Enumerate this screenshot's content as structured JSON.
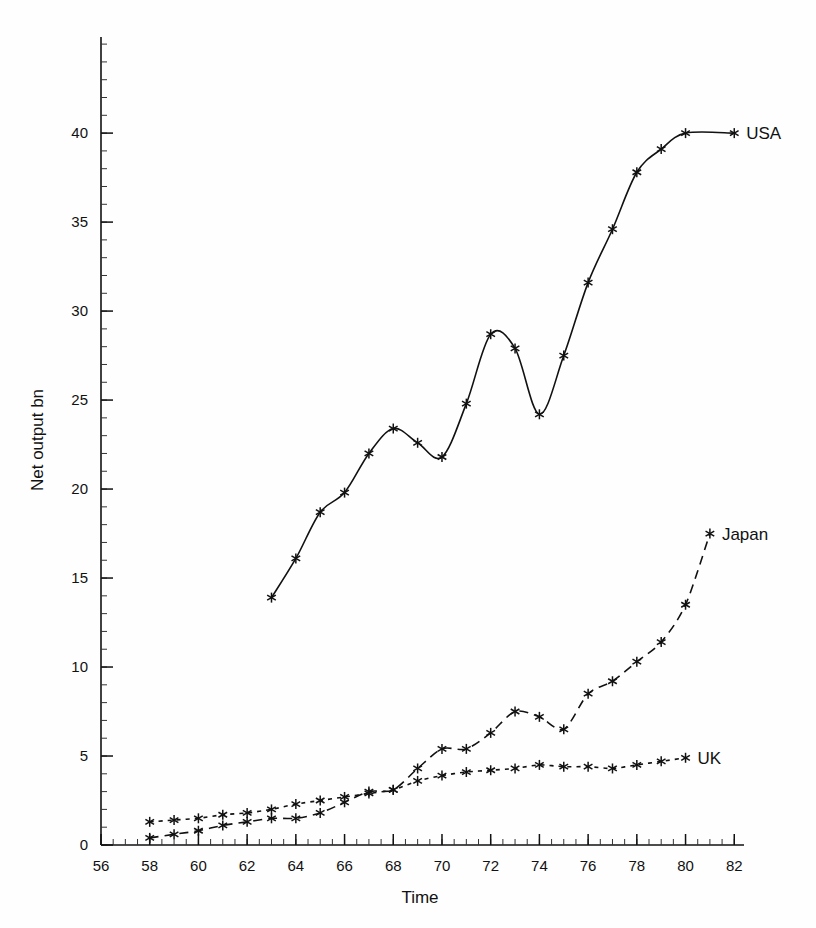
{
  "chart_data": {
    "type": "line",
    "title": "",
    "xlabel": "Time",
    "ylabel": "Net output bn",
    "xlim": [
      56,
      82.4
    ],
    "ylim": [
      0,
      45.4
    ],
    "xticks": [
      56,
      58,
      60,
      62,
      64,
      66,
      68,
      70,
      72,
      74,
      76,
      78,
      80,
      82
    ],
    "xtick_labels": [
      "56",
      "58",
      "60",
      "62",
      "64",
      "66",
      "68",
      "70",
      "72",
      "74",
      "76",
      "78",
      "80",
      "82"
    ],
    "yticks": [
      0,
      5,
      10,
      15,
      20,
      25,
      30,
      35,
      40
    ],
    "ytick_labels": [
      "0",
      "5",
      "10",
      "15",
      "20",
      "25",
      "30",
      "35",
      "40"
    ],
    "x_minor_step": 0.5,
    "y_minor_step": 1,
    "grid": false,
    "legend_position": "inline-end-of-line",
    "marker": "asterisk",
    "series": [
      {
        "name": "USA",
        "label": "USA",
        "linestyle": "solid",
        "color": "#111111",
        "x": [
          63,
          64,
          65,
          66,
          67,
          68,
          69,
          70,
          71,
          72,
          73,
          74,
          75,
          76,
          77,
          78,
          79,
          80,
          81,
          82
        ],
        "values": [
          13.9,
          16.1,
          18.7,
          19.8,
          22.0,
          23.4,
          22.6,
          21.8,
          24.8,
          28.7,
          27.9,
          24.2,
          27.5,
          31.6,
          34.6,
          37.8,
          39.1,
          40.0,
          40.0,
          40.0
        ]
      },
      {
        "name": "Japan",
        "label": "Japan",
        "linestyle": "dashed",
        "color": "#111111",
        "x": [
          58,
          59,
          60,
          61,
          62,
          63,
          64,
          65,
          66,
          67,
          68,
          69,
          70,
          71,
          72,
          73,
          74,
          75,
          76,
          77,
          78,
          79,
          80,
          81
        ],
        "values": [
          0.4,
          0.6,
          0.8,
          1.1,
          1.3,
          1.5,
          1.5,
          1.8,
          2.4,
          3.0,
          3.1,
          4.3,
          5.4,
          5.4,
          6.3,
          7.5,
          7.2,
          6.5,
          8.5,
          9.2,
          10.3,
          11.4,
          13.5,
          17.5
        ]
      },
      {
        "name": "UK",
        "label": "UK",
        "linestyle": "dotted",
        "color": "#111111",
        "x": [
          58,
          59,
          60,
          61,
          62,
          63,
          64,
          65,
          66,
          67,
          68,
          69,
          70,
          71,
          72,
          73,
          74,
          75,
          76,
          77,
          78,
          79,
          80
        ],
        "values": [
          1.3,
          1.4,
          1.5,
          1.7,
          1.8,
          2.0,
          2.3,
          2.5,
          2.7,
          2.9,
          3.1,
          3.6,
          3.9,
          4.1,
          4.2,
          4.3,
          4.5,
          4.4,
          4.4,
          4.3,
          4.5,
          4.7,
          4.9
        ]
      }
    ],
    "annotations": [
      {
        "name": "usa-label",
        "text": "USA",
        "x": 82,
        "y": 40.0
      },
      {
        "name": "japan-label",
        "text": "Japan",
        "x": 81,
        "y": 17.5
      },
      {
        "name": "uk-label",
        "text": "UK",
        "x": 80,
        "y": 4.9
      }
    ]
  }
}
